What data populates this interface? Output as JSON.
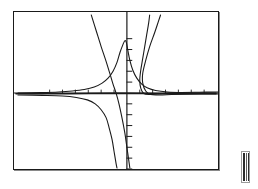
{
  "document": {
    "kind": "mathematical-function-plot",
    "description": "Black and white line plot of rational functions on a rectangular coordinate frame",
    "background_color": "#ffffff",
    "ink_color": "#1a1a1a"
  },
  "frame": {
    "name": "plot-border",
    "x": 13,
    "y": 11,
    "width": 206,
    "height": 159,
    "border_color": "#1a1a1a",
    "border_width": 1.3
  },
  "side_bar": {
    "name": "vertical-scroll-bar",
    "x": 241,
    "y": 151,
    "width": 9,
    "height": 32,
    "stripe_count": 3,
    "color": "#2b2b2b"
  },
  "chart_data": {
    "type": "line",
    "title": "",
    "subtitle": "",
    "xlabel": "",
    "ylabel": "",
    "grid": false,
    "legend": "none",
    "xlim": [
      -10,
      10
    ],
    "ylim": [
      -8,
      8
    ],
    "axes": {
      "x_axis": {
        "name": "x-axis",
        "y_pixel": 93,
        "stroke_width": 1.2,
        "thickened": true,
        "note": "horizontal axis rendered thick/dark due to curves hugging it"
      },
      "y_axis": {
        "name": "y-axis",
        "x_pixel": 127,
        "stroke_width": 1.2,
        "tick_count_above": 5,
        "tick_count_below": 7,
        "tick_length_px": 5
      }
    },
    "series": [
      {
        "name": "peaked-bell-curve",
        "color": "#1a1a1a",
        "stroke_width": 1.1,
        "description": "Sharp peak just left of the y-axis, decaying to the x-axis on both sides",
        "points_px": [
          [
            17,
            93
          ],
          [
            40,
            92.6
          ],
          [
            58,
            92
          ],
          [
            72,
            91
          ],
          [
            84,
            89.5
          ],
          [
            94,
            87
          ],
          [
            102,
            83
          ],
          [
            108,
            78
          ],
          [
            113,
            71
          ],
          [
            117,
            62
          ],
          [
            120,
            52
          ],
          [
            123,
            44
          ],
          [
            125,
            40
          ],
          [
            126.5,
            42
          ],
          [
            128,
            50
          ],
          [
            130,
            60
          ],
          [
            133,
            70
          ],
          [
            137,
            78
          ],
          [
            142,
            84
          ],
          [
            148,
            88
          ],
          [
            156,
            90.5
          ],
          [
            168,
            92
          ],
          [
            185,
            92.7
          ],
          [
            205,
            93
          ],
          [
            217,
            93
          ]
        ]
      },
      {
        "name": "lower-branch-left",
        "color": "#1a1a1a",
        "stroke_width": 1.1,
        "description": "Reflected branch below the axis on the left, descending steeply toward the vertical asymptote",
        "points_px": [
          [
            17,
            95
          ],
          [
            42,
            95.4
          ],
          [
            62,
            96
          ],
          [
            76,
            97.5
          ],
          [
            87,
            100
          ],
          [
            95,
            104
          ],
          [
            101,
            110
          ],
          [
            106,
            118
          ],
          [
            109,
            128
          ],
          [
            112,
            140
          ],
          [
            114,
            152
          ],
          [
            116,
            164
          ],
          [
            117,
            169
          ]
        ]
      },
      {
        "name": "steep-line-upper-left",
        "color": "#1a1a1a",
        "stroke_width": 1.1,
        "description": "Nearly straight steep branch entering at the top-left, falling through the axis and continuing down",
        "points_px": [
          [
            91,
            14
          ],
          [
            96,
            30
          ],
          [
            101,
            46
          ],
          [
            106,
            61
          ],
          [
            110,
            74
          ],
          [
            113,
            84
          ],
          [
            116,
            93
          ],
          [
            119,
            104
          ],
          [
            122,
            118
          ],
          [
            125,
            134
          ],
          [
            127,
            148
          ],
          [
            129,
            162
          ],
          [
            130,
            169
          ]
        ]
      },
      {
        "name": "right-branch-inner",
        "color": "#1a1a1a",
        "stroke_width": 1.1,
        "description": "Branch rising from near the axis on the right up through the top of the frame",
        "points_px": [
          [
            219,
            92
          ],
          [
            200,
            92.2
          ],
          [
            182,
            92.6
          ],
          [
            168,
            93.2
          ],
          [
            158,
            94
          ],
          [
            150,
            94.6
          ],
          [
            144,
            93.5
          ],
          [
            141,
            88
          ],
          [
            140,
            80
          ],
          [
            141,
            70
          ],
          [
            143,
            58
          ],
          [
            145,
            46
          ],
          [
            147,
            34
          ],
          [
            149,
            22
          ],
          [
            150,
            14
          ]
        ]
      },
      {
        "name": "right-branch-outer",
        "color": "#1a1a1a",
        "stroke_width": 1.1,
        "description": "Second rising branch to the right of the inner one, steeper near the top",
        "points_px": [
          [
            219,
            94
          ],
          [
            202,
            94
          ],
          [
            186,
            94.2
          ],
          [
            172,
            94.6
          ],
          [
            160,
            95
          ],
          [
            151,
            94.6
          ],
          [
            146,
            91
          ],
          [
            143,
            83
          ],
          [
            143,
            73
          ],
          [
            146,
            60
          ],
          [
            150,
            46
          ],
          [
            155,
            32
          ],
          [
            159,
            20
          ],
          [
            161,
            14
          ]
        ]
      },
      {
        "name": "axis-hugging-trace",
        "color": "#1a1a1a",
        "stroke_width": 1.6,
        "description": "Dense overlapping trace along the x-axis giving it a thick banded appearance",
        "points_px": [
          [
            15,
            93.8
          ],
          [
            50,
            93.8
          ],
          [
            90,
            93.6
          ],
          [
            120,
            93.4
          ],
          [
            150,
            93.6
          ],
          [
            190,
            93.8
          ],
          [
            217,
            93.8
          ]
        ]
      }
    ],
    "annotations": [
      {
        "name": "vertical-asymptote",
        "at_x_px": 127,
        "note": "curves diverge to +inf and -inf near the y-axis"
      },
      {
        "name": "horizontal-asymptote",
        "at_y_px": 93,
        "note": "curves approach the x-axis at both extremes"
      }
    ]
  }
}
